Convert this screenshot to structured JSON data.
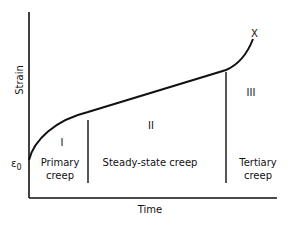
{
  "diagram": {
    "type": "creep-curve",
    "axes": {
      "y_label": "Strain",
      "x_label": "Time",
      "origin_label": "ε",
      "origin_subscript": "0"
    },
    "curve_end_marker": "X",
    "stages": [
      {
        "numeral": "I",
        "line1": "Primary",
        "line2": "creep"
      },
      {
        "numeral": "II",
        "line1": "Steady-state creep",
        "line2": ""
      },
      {
        "numeral": "III",
        "line1": "Tertiary",
        "line2": "creep"
      }
    ],
    "colors": {
      "ink": "#111111",
      "background": "#ffffff"
    }
  }
}
